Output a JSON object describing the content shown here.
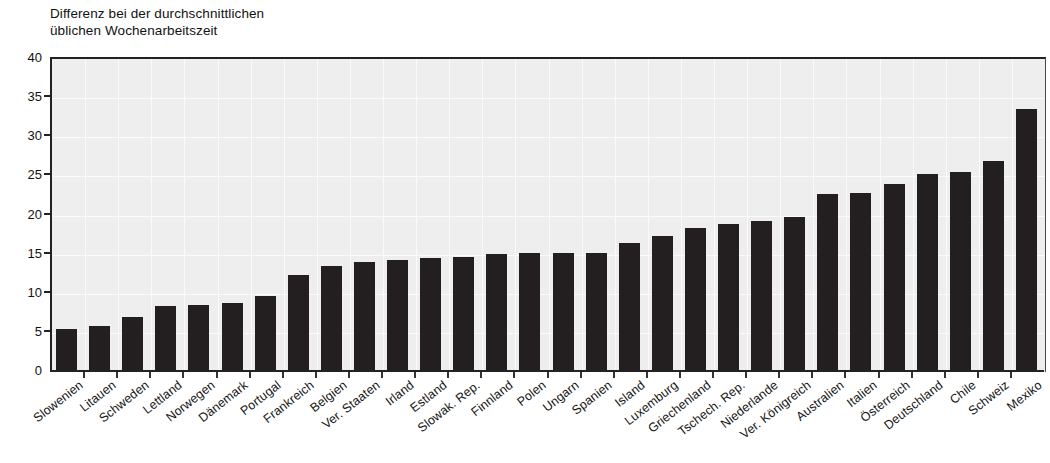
{
  "chart_data": {
    "type": "bar",
    "title": "Differenz bei der durchschnittlichen\nüblichen Wochenarbeitszeit",
    "xlabel": "",
    "ylabel": "",
    "ylim": [
      0,
      40
    ],
    "yticks": [
      0,
      5,
      10,
      15,
      20,
      25,
      30,
      35,
      40
    ],
    "grid": true,
    "legend": null,
    "bar_color": "#231f20",
    "plot_background": "#eeeeee",
    "categories": [
      "Slowenien",
      "Litauen",
      "Schweden",
      "Lettland",
      "Norwegen",
      "Dänemark",
      "Portugal",
      "Frankreich",
      "Belgien",
      "Ver. Staaten",
      "Irland",
      "Estland",
      "Slowak. Rep.",
      "Finnland",
      "Polen",
      "Ungarn",
      "Spanien",
      "Island",
      "Luxemburg",
      "Griechenland",
      "Tschech. Rep.",
      "Niederlande",
      "Ver. Königreich",
      "Australien",
      "Italien",
      "Österreich",
      "Deutschland",
      "Chile",
      "Schweiz",
      "Mexiko"
    ],
    "values": [
      5.3,
      5.6,
      6.8,
      8.2,
      8.3,
      8.6,
      9.4,
      12.2,
      13.3,
      13.8,
      14.0,
      14.3,
      14.5,
      14.8,
      15.0,
      15.0,
      15.0,
      16.2,
      17.1,
      18.1,
      18.6,
      19.0,
      19.6,
      22.5,
      22.6,
      23.8,
      25.1,
      25.3,
      26.7,
      33.4
    ]
  }
}
